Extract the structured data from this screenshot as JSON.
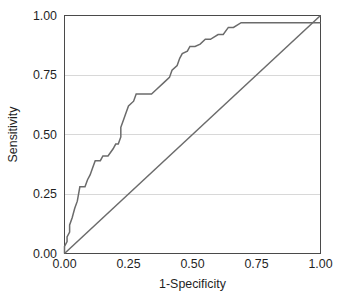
{
  "chart_data": {
    "type": "line",
    "title": "",
    "subtitle": "",
    "xlabel": "1-Specificity",
    "ylabel": "Sensitivity",
    "xlim": [
      0.0,
      1.0
    ],
    "ylim": [
      0.0,
      1.0
    ],
    "grid": true,
    "grid_axis": "y",
    "legend": "none",
    "xticks": [
      "0.00",
      "0.25",
      "0.50",
      "0.75",
      "1.00"
    ],
    "xtick_values": [
      0.0,
      0.25,
      0.5,
      0.75,
      1.0
    ],
    "yticks": [
      "0.00",
      "0.25",
      "0.50",
      "0.75",
      "1.00"
    ],
    "ytick_values": [
      0.0,
      0.25,
      0.5,
      0.75,
      1.0
    ],
    "series": [
      {
        "name": "ROC curve",
        "style": "step",
        "color": "#6b6b6b",
        "x": [
          0.0,
          0.0,
          0.0,
          0.01,
          0.01,
          0.01,
          0.01,
          0.02,
          0.02,
          0.02,
          0.02,
          0.03,
          0.03,
          0.04,
          0.04,
          0.05,
          0.05,
          0.06,
          0.06,
          0.08,
          0.08,
          0.09,
          0.09,
          0.1,
          0.1,
          0.11,
          0.11,
          0.12,
          0.12,
          0.14,
          0.14,
          0.15,
          0.15,
          0.17,
          0.17,
          0.19,
          0.19,
          0.2,
          0.2,
          0.21,
          0.21,
          0.22,
          0.22,
          0.22,
          0.22,
          0.23,
          0.23,
          0.24,
          0.24,
          0.25,
          0.25,
          0.27,
          0.27,
          0.28,
          0.28,
          0.34,
          0.34,
          0.36,
          0.36,
          0.39,
          0.39,
          0.41,
          0.41,
          0.42,
          0.42,
          0.44,
          0.44,
          0.45,
          0.45,
          0.46,
          0.46,
          0.48,
          0.48,
          0.49,
          0.49,
          0.51,
          0.51,
          0.53,
          0.53,
          0.55,
          0.55,
          0.57,
          0.57,
          0.6,
          0.6,
          0.62,
          0.62,
          0.64,
          0.64,
          0.66,
          0.66,
          0.69,
          0.69,
          1.0
        ],
        "y": [
          0.0,
          0.03,
          0.03,
          0.05,
          0.05,
          0.07,
          0.07,
          0.09,
          0.09,
          0.12,
          0.12,
          0.15,
          0.15,
          0.19,
          0.19,
          0.22,
          0.22,
          0.28,
          0.28,
          0.28,
          0.28,
          0.31,
          0.31,
          0.33,
          0.33,
          0.36,
          0.36,
          0.39,
          0.39,
          0.39,
          0.39,
          0.41,
          0.41,
          0.41,
          0.41,
          0.44,
          0.44,
          0.46,
          0.46,
          0.46,
          0.46,
          0.49,
          0.49,
          0.53,
          0.53,
          0.56,
          0.56,
          0.59,
          0.59,
          0.62,
          0.62,
          0.64,
          0.64,
          0.67,
          0.67,
          0.67,
          0.67,
          0.69,
          0.69,
          0.72,
          0.72,
          0.74,
          0.74,
          0.77,
          0.77,
          0.79,
          0.79,
          0.82,
          0.82,
          0.84,
          0.84,
          0.85,
          0.85,
          0.87,
          0.87,
          0.87,
          0.87,
          0.88,
          0.88,
          0.9,
          0.9,
          0.9,
          0.9,
          0.92,
          0.92,
          0.92,
          0.92,
          0.95,
          0.95,
          0.95,
          0.95,
          0.97,
          0.97,
          0.97
        ]
      },
      {
        "name": "Reference diagonal",
        "style": "line",
        "color": "#6b6b6b",
        "x": [
          0.0,
          1.0
        ],
        "y": [
          0.0,
          1.0
        ]
      }
    ]
  },
  "style": {
    "background": "#ffffff",
    "frame_color": "#4a4a4a",
    "grid_color": "#d8d8d8",
    "curve_color": "#6b6b6b",
    "diagonal_color": "#6b6b6b",
    "text_color": "#1f1f1f"
  }
}
